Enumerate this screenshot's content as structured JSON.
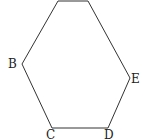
{
  "figure": {
    "type": "hexagon",
    "stroke_color": "#333333",
    "vertices": [
      {
        "label": "",
        "x": 58,
        "y": 1
      },
      {
        "label": "",
        "x": 88,
        "y": 1
      },
      {
        "label": "E",
        "x": 130,
        "y": 78
      },
      {
        "label": "D",
        "x": 108,
        "y": 128
      },
      {
        "label": "C",
        "x": 52,
        "y": 128
      },
      {
        "label": "B",
        "x": 22,
        "y": 64
      }
    ],
    "labels": {
      "B": "B",
      "C": "C",
      "D": "D",
      "E": "E"
    }
  }
}
